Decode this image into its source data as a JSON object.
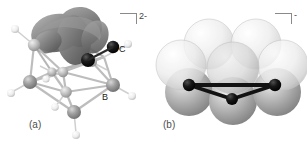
{
  "figure": {
    "background_color": "#ffffff",
    "width": 307,
    "height": 148
  },
  "panels": [
    {
      "id": "a",
      "caption": "(a)",
      "charge": "2-",
      "bracket": "right-angle-bracket",
      "representation": "ball-and-stick cluster with molecular orbital isosurface",
      "atom_labels": [
        {
          "text": "C",
          "element": "carbon",
          "color": "#111111"
        },
        {
          "text": "B",
          "element": "boron",
          "color": "#8c8c8c"
        }
      ],
      "colors": {
        "carbon": "#111111",
        "boron": "#8f8f8f",
        "hydrogen": "#e2e2e2",
        "bond": "#a8a8a8",
        "orbital_lobe": "#8e8e8e",
        "orbital_lobe_dark": "#6f6f6f"
      }
    },
    {
      "id": "b",
      "caption": "(b)",
      "charge": "-",
      "bracket": "right-angle-bracket",
      "representation": "space-filling translucent spheres with highlighted bonded core",
      "atom_labels": [],
      "colors": {
        "sphere_light": "#e8e8e8",
        "sphere_dark": "#9a9a9a",
        "core_atom": "#111111",
        "core_bond": "#111111"
      }
    }
  ],
  "colors": {
    "bracket": "#8a8a8a",
    "caption_text": "#4d4d4d",
    "atom_label_text": "#1a1a1a",
    "charge_text": "#444444"
  }
}
